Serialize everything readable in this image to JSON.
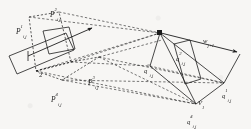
{
  "figure": {
    "background_color": "#f7f6f4",
    "stroke_color": "#1c1c1c",
    "width": 251,
    "height": 129
  },
  "labels": {
    "p1": {
      "base": "P",
      "sup": "1",
      "sub": "i,j",
      "x": 16,
      "y": 23
    },
    "p2": {
      "base": "P",
      "sup": "2",
      "sub": "i,j",
      "x": 50,
      "y": 6
    },
    "p3": {
      "base": "P",
      "sup": "3",
      "sub": "i,j",
      "x": 88,
      "y": 73
    },
    "p4": {
      "base": "P",
      "sup": "4",
      "sub": "i,j",
      "x": 51,
      "y": 90
    },
    "q1": {
      "base": "q",
      "sup": "1",
      "sub": "i,j",
      "x": 222,
      "y": 86
    },
    "q2": {
      "base": "q",
      "sup": "2",
      "sub": "i,j",
      "x": 176,
      "y": 49
    },
    "q3": {
      "base": "q",
      "sup": "3",
      "sub": "i,j",
      "x": 145,
      "y": 61
    },
    "q4": {
      "base": "q",
      "sup": "4",
      "sub": "i,j",
      "x": 187,
      "y": 112
    },
    "w": {
      "base": "w",
      "sup": "",
      "sub": "j+1",
      "x": 203,
      "y": 31
    },
    "v": {
      "base": "V",
      "sup": "",
      "sub": "1",
      "x": 198,
      "y": 93
    },
    "two": {
      "base": "2",
      "sup": "",
      "sub": "",
      "x": 39,
      "y": 65
    }
  },
  "geometry": {
    "left_solid_quad": "10,55 63,33 71,48 18,72",
    "left_small_rect": "38,31 63,27 69,46 44,51",
    "left_dashed_quad": "27,16 58,11 70,62 35,70",
    "center_dashed_quad": "35,70 70,62 98,58 61,79",
    "right_solid_quad": "158,32 178,63 196,104 168,72",
    "right_inner_quad": "172,45 185,41 196,79 183,83",
    "arrow_main": "M 30,55 L 94,28",
    "arrow_w": "M 158,32 L 240,53",
    "vertex_marker_1": "158,32",
    "vertex_marker_2": "240,53"
  }
}
